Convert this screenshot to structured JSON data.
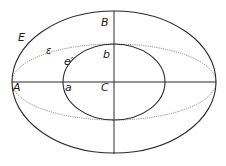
{
  "diagram": {
    "type": "geometric-ellipses",
    "center": {
      "x": 114,
      "y": 82
    },
    "colors": {
      "stroke": "#2a2a2a",
      "dotted": "#555555",
      "background": "#ffffff"
    },
    "shapes": {
      "outer_ellipse": {
        "name": "E",
        "rx": 102,
        "ry": 71,
        "style": "solid"
      },
      "middle_ellipse": {
        "name": "ε",
        "rx": 102,
        "ry": 38,
        "style": "dotted"
      },
      "inner_ellipse": {
        "name": "e′",
        "rx": 51,
        "ry": 38,
        "style": "solid"
      }
    },
    "axes": {
      "horizontal": {
        "x1": 12,
        "x2": 216,
        "y": 82
      },
      "vertical": {
        "x": 114,
        "y1": 11,
        "y2": 154
      }
    },
    "labels": {
      "E": "E",
      "epsilon": "ε",
      "B": "B",
      "b": "b",
      "e_prime": "e′",
      "A": "A",
      "a": "a",
      "C": "C"
    }
  }
}
